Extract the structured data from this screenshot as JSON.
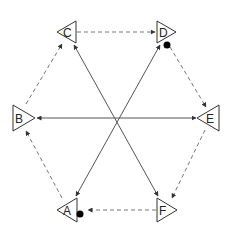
{
  "diagram": {
    "type": "directed-graph",
    "layout": "hexagon",
    "colors": {
      "stroke": "#333333",
      "edge_solid": "#555555",
      "edge_dashed": "#777777",
      "marker_dot": "#000000",
      "background": "#ffffff"
    },
    "nodes": [
      {
        "id": "A",
        "label": "A",
        "shape": "triangle",
        "points": "left",
        "cx": 68,
        "cy": 210
      },
      {
        "id": "B",
        "label": "B",
        "shape": "triangle",
        "points": "right",
        "cx": 23,
        "cy": 118
      },
      {
        "id": "C",
        "label": "C",
        "shape": "triangle",
        "points": "left",
        "cx": 67,
        "cy": 32
      },
      {
        "id": "D",
        "label": "D",
        "shape": "triangle",
        "points": "right",
        "cx": 165,
        "cy": 32
      },
      {
        "id": "E",
        "label": "E",
        "shape": "triangle",
        "points": "left",
        "cx": 209,
        "cy": 118
      },
      {
        "id": "F",
        "label": "F",
        "shape": "triangle",
        "points": "right",
        "cx": 166,
        "cy": 210
      }
    ],
    "edges": [
      {
        "from": "C",
        "to": "D",
        "style": "dashed",
        "direction": "forward"
      },
      {
        "from": "D",
        "to": "E",
        "style": "dashed",
        "direction": "forward"
      },
      {
        "from": "E",
        "to": "F",
        "style": "dashed",
        "direction": "forward"
      },
      {
        "from": "F",
        "to": "A",
        "style": "dashed",
        "direction": "forward"
      },
      {
        "from": "A",
        "to": "B",
        "style": "dashed",
        "direction": "forward"
      },
      {
        "from": "B",
        "to": "C",
        "style": "dashed",
        "direction": "forward"
      },
      {
        "from": "B",
        "to": "E",
        "style": "solid",
        "direction": "both"
      },
      {
        "from": "C",
        "to": "F",
        "style": "solid",
        "direction": "both"
      },
      {
        "from": "D",
        "to": "A",
        "style": "solid",
        "direction": "both"
      }
    ],
    "markers": [
      {
        "near": "D",
        "shape": "dot",
        "cx": 167,
        "cy": 45
      },
      {
        "near": "A",
        "shape": "dot",
        "cx": 80,
        "cy": 214
      }
    ]
  }
}
